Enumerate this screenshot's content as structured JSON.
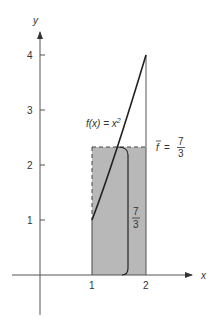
{
  "figure": {
    "x_axis_label": "x",
    "y_axis_label": "y",
    "x_ticks": [
      "1",
      "2"
    ],
    "y_ticks": [
      "1",
      "2",
      "3",
      "4"
    ],
    "function_label": {
      "prefix": "f(x) = x",
      "exponent": "2"
    },
    "mean_label": {
      "symbol": "f",
      "equals": "=",
      "numerator": "7",
      "denominator": "3"
    },
    "brace_label": {
      "numerator": "7",
      "denominator": "3"
    },
    "colors": {
      "shade": "#b8b8b8",
      "axis": "#555555",
      "curve": "#222222"
    }
  }
}
